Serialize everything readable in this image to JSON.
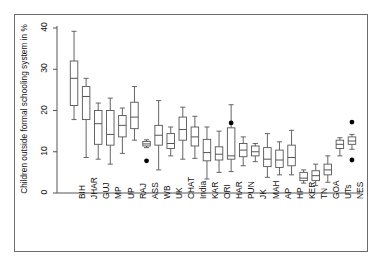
{
  "chart_data": {
    "type": "boxplot",
    "title": "",
    "xlabel": "",
    "ylabel": "Children outside formal schooling system in %",
    "ylim": [
      0,
      42
    ],
    "yticks": [
      0,
      10,
      20,
      30,
      40
    ],
    "ytick_labels": [
      "0",
      "10",
      "20",
      "30",
      "40"
    ],
    "grid": false,
    "legend": false,
    "categories": [
      "BIH",
      "JHAR",
      "GUJ",
      "MP",
      "UP",
      "RAJ",
      "ASS",
      "WB",
      "UK",
      "CHAT",
      "India",
      "KAR",
      "ORI",
      "HAR",
      "PUN",
      "JK",
      "MAH",
      "AP",
      "HP",
      "KER",
      "TN",
      "GOA",
      "UTs",
      "NES"
    ],
    "boxes": [
      {
        "category": "BIH",
        "whisker_low": 17.8,
        "q1": 21.2,
        "median": 27.8,
        "q3": 32.0,
        "whisker_high": 39.2,
        "outliers": []
      },
      {
        "category": "JHAR",
        "whisker_low": 8.6,
        "q1": 17.8,
        "median": 23.4,
        "q3": 25.8,
        "whisker_high": 27.8,
        "outliers": []
      },
      {
        "category": "GUJ",
        "whisker_low": 8.2,
        "q1": 11.8,
        "median": 16.8,
        "q3": 20.0,
        "whisker_high": 21.8,
        "outliers": []
      },
      {
        "category": "MP",
        "whisker_low": 7.0,
        "q1": 11.6,
        "median": 14.2,
        "q3": 20.0,
        "whisker_high": 23.0,
        "outliers": []
      },
      {
        "category": "UP",
        "whisker_low": 9.6,
        "q1": 13.6,
        "median": 16.4,
        "q3": 18.8,
        "whisker_high": 20.6,
        "outliers": []
      },
      {
        "category": "RAJ",
        "whisker_low": 12.8,
        "q1": 15.6,
        "median": 18.4,
        "q3": 22.0,
        "whisker_high": 25.8,
        "outliers": []
      },
      {
        "category": "ASS",
        "whisker_low": 11.0,
        "q1": 11.4,
        "median": 11.9,
        "q3": 12.5,
        "whisker_high": 12.9,
        "outliers": [
          7.8
        ]
      },
      {
        "category": "WB",
        "whisker_low": 5.6,
        "q1": 11.6,
        "median": 14.0,
        "q3": 16.4,
        "whisker_high": 22.4,
        "outliers": []
      },
      {
        "category": "UK",
        "whisker_low": 9.0,
        "q1": 10.8,
        "median": 12.0,
        "q3": 14.4,
        "whisker_high": 16.0,
        "outliers": []
      },
      {
        "category": "CHAT",
        "whisker_low": 8.2,
        "q1": 12.8,
        "median": 15.4,
        "q3": 18.4,
        "whisker_high": 20.8,
        "outliers": []
      },
      {
        "category": "India",
        "whisker_low": 8.4,
        "q1": 11.4,
        "median": 13.6,
        "q3": 16.0,
        "whisker_high": 18.6,
        "outliers": []
      },
      {
        "category": "KAR",
        "whisker_low": 3.4,
        "q1": 7.8,
        "median": 9.8,
        "q3": 13.0,
        "whisker_high": 16.0,
        "outliers": []
      },
      {
        "category": "ORI",
        "whisker_low": 5.0,
        "q1": 8.0,
        "median": 9.4,
        "q3": 11.2,
        "whisker_high": 15.0,
        "outliers": []
      },
      {
        "category": "HAR",
        "whisker_low": 5.2,
        "q1": 8.2,
        "median": 9.0,
        "q3": 15.8,
        "whisker_high": 21.4,
        "outliers": [
          17.0
        ]
      },
      {
        "category": "PUN",
        "whisker_low": 6.6,
        "q1": 8.8,
        "median": 10.4,
        "q3": 12.0,
        "whisker_high": 13.6,
        "outliers": []
      },
      {
        "category": "JK",
        "whisker_low": 7.6,
        "q1": 9.0,
        "median": 10.0,
        "q3": 11.4,
        "whisker_high": 12.0,
        "outliers": []
      },
      {
        "category": "MAH",
        "whisker_low": 3.8,
        "q1": 6.4,
        "median": 8.2,
        "q3": 11.0,
        "whisker_high": 14.4,
        "outliers": []
      },
      {
        "category": "AP",
        "whisker_low": 4.4,
        "q1": 6.2,
        "median": 8.0,
        "q3": 10.4,
        "whisker_high": 12.4,
        "outliers": []
      },
      {
        "category": "HP",
        "whisker_low": 4.4,
        "q1": 6.6,
        "median": 8.6,
        "q3": 11.6,
        "whisker_high": 15.2,
        "outliers": []
      },
      {
        "category": "KER",
        "whisker_low": 2.4,
        "q1": 3.0,
        "median": 3.6,
        "q3": 5.0,
        "whisker_high": 5.6,
        "outliers": []
      },
      {
        "category": "TN",
        "whisker_low": 1.8,
        "q1": 3.0,
        "median": 4.2,
        "q3": 5.4,
        "whisker_high": 7.0,
        "outliers": []
      },
      {
        "category": "GOA",
        "whisker_low": 2.6,
        "q1": 4.4,
        "median": 5.6,
        "q3": 7.0,
        "whisker_high": 9.0,
        "outliers": []
      },
      {
        "category": "UTs",
        "whisker_low": 9.0,
        "q1": 10.8,
        "median": 11.8,
        "q3": 12.8,
        "whisker_high": 13.4,
        "outliers": []
      },
      {
        "category": "NES",
        "whisker_low": 10.6,
        "q1": 11.8,
        "median": 12.6,
        "q3": 13.6,
        "whisker_high": 14.2,
        "outliers": [
          17.2,
          8.0
        ]
      }
    ],
    "colors": {
      "line": "#555555",
      "outlier": "#000000",
      "frame": "#6b6b6b",
      "text": "#111111"
    }
  }
}
